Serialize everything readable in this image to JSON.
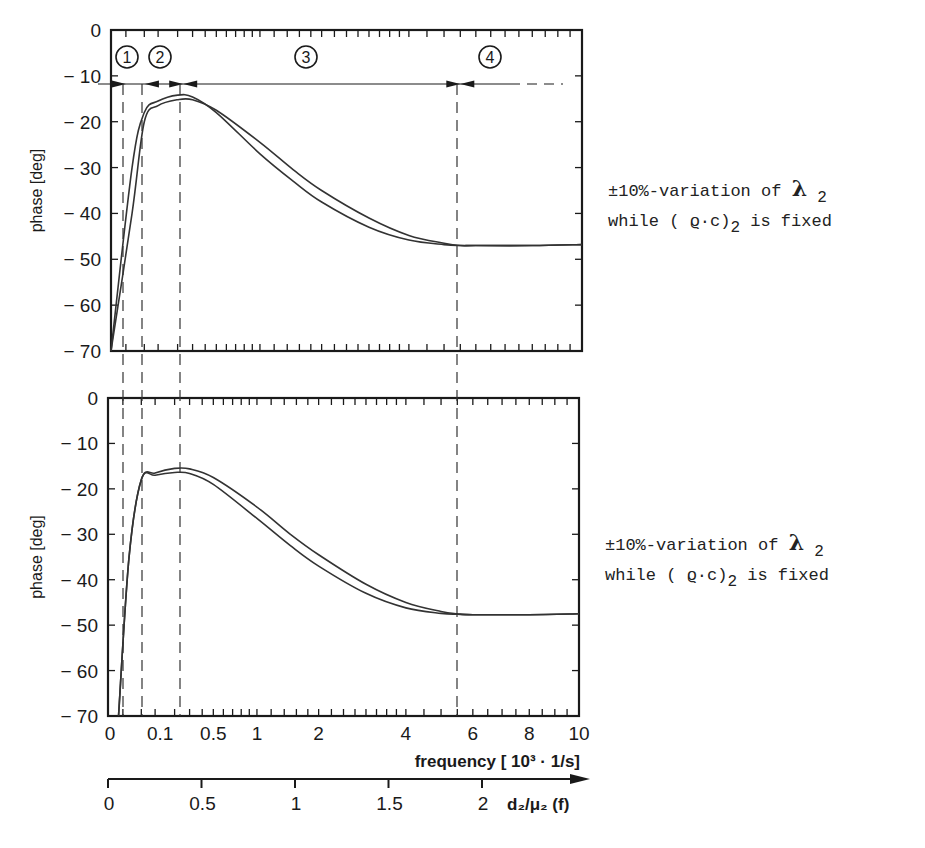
{
  "chart_data": [
    {
      "type": "line",
      "title": "",
      "xlabel": "frequency [ 10^3 · 1/s ]",
      "ylabel": "phase [deg]",
      "xscale": "sqrt",
      "xlim": [
        0,
        10
      ],
      "ylim": [
        -70,
        0
      ],
      "xticks": [
        0,
        0.1,
        0.5,
        1,
        2,
        4,
        6,
        8,
        10
      ],
      "yticks": [
        0,
        -10,
        -20,
        -30,
        -40,
        -50,
        -60,
        -70
      ],
      "region_markers": {
        "labels": [
          "1",
          "2",
          "3",
          "4"
        ],
        "boundaries_freq": [
          0.01,
          0.052,
          0.235,
          5.5
        ]
      },
      "series": [
        {
          "name": "lambda2 +10%",
          "x": [
            0.0,
            0.02,
            0.05,
            0.1,
            0.2,
            0.3,
            0.5,
            1,
            1.5,
            2,
            3,
            4,
            5,
            5.5,
            6,
            8,
            10
          ],
          "values": [
            -70,
            -30,
            -18,
            -15.5,
            -14.2,
            -14.6,
            -18,
            -27,
            -33,
            -37.5,
            -43,
            -45.8,
            -46.8,
            -47,
            -47,
            -47,
            -46.8
          ]
        },
        {
          "name": "lambda2 -10%",
          "x": [
            0.0,
            0.02,
            0.05,
            0.1,
            0.2,
            0.3,
            0.5,
            1,
            1.5,
            2,
            3,
            4,
            5,
            5.5,
            6,
            8,
            10
          ],
          "values": [
            -70,
            -40,
            -20,
            -16.5,
            -15.2,
            -15.2,
            -17.5,
            -24.5,
            -30.5,
            -35,
            -41,
            -44.8,
            -46.5,
            -47,
            -47,
            -47,
            -46.8
          ]
        }
      ],
      "annotation": "±10%-variation of λ2 while (ϱ·c)2 is fixed"
    },
    {
      "type": "line",
      "title": "",
      "xlabel": "frequency [ 10^3 · 1/s ]",
      "ylabel": "phase [deg]",
      "xscale": "sqrt",
      "xlim": [
        0,
        10
      ],
      "ylim": [
        -70,
        0
      ],
      "xticks": [
        0,
        0.1,
        0.5,
        1,
        2,
        4,
        6,
        8,
        10
      ],
      "yticks": [
        0,
        -10,
        -20,
        -30,
        -40,
        -50,
        -60,
        -70
      ],
      "series": [
        {
          "name": "curve A",
          "x": [
            0.005,
            0.02,
            0.05,
            0.1,
            0.2,
            0.3,
            0.5,
            1,
            1.5,
            2,
            3,
            4,
            5,
            5.5,
            6,
            8,
            10
          ],
          "values": [
            -70,
            -35,
            -18,
            -16.5,
            -15.5,
            -15.6,
            -17.5,
            -24,
            -30,
            -34.5,
            -41,
            -45,
            -47,
            -47.5,
            -47.7,
            -47.7,
            -47.5
          ]
        },
        {
          "name": "curve B",
          "x": [
            0.005,
            0.02,
            0.05,
            0.1,
            0.2,
            0.3,
            0.5,
            1,
            1.5,
            2,
            3,
            4,
            5,
            5.5,
            6,
            8,
            10
          ],
          "values": [
            -70,
            -35,
            -18,
            -17,
            -16.4,
            -16.6,
            -19,
            -26.5,
            -32.5,
            -37,
            -43,
            -46.2,
            -47.4,
            -47.6,
            -47.7,
            -47.7,
            -47.5
          ]
        }
      ],
      "annotation": "±10%-variation of λ2 while (ϱ·c)2 is fixed"
    }
  ],
  "upper": {
    "y_axis_label": "phase [deg]",
    "y_tick_labels": [
      "0",
      "− 10",
      "− 20",
      "− 30",
      "− 40",
      "− 50",
      "− 60",
      "− 70"
    ],
    "regions": [
      "1",
      "2",
      "3",
      "4"
    ],
    "note_line1_prefix": "±10%-variation  of ",
    "note_lambda": "λ",
    "note_sub": "2",
    "note_line2_a": "while ( ",
    "note_rho": "ϱ",
    "note_line2_b": "·c)",
    "note_sub2": "2",
    "note_line2_c": " is fixed"
  },
  "lower": {
    "y_axis_label": "phase [deg]",
    "y_tick_labels": [
      "0",
      "− 10",
      "− 20",
      "− 30",
      "− 40",
      "− 50",
      "− 60",
      "− 70"
    ],
    "x_tick_labels": [
      "0",
      "0.1",
      "0.5",
      "1",
      "2",
      "4",
      "6",
      "8",
      "10"
    ],
    "x_axis_label": "frequency [ 10³ · 1/s]",
    "note_line1_prefix": "±10%-variation of ",
    "note_lambda": "λ",
    "note_sub": "2",
    "note_line2_a": "while ( ",
    "note_rho": "ϱ",
    "note_line2_b": "·c)",
    "note_sub2": "2",
    "note_line2_c": " is fixed"
  },
  "secondary_axis": {
    "tick_labels": [
      "0",
      "0.5",
      "1",
      "1.5",
      "2"
    ],
    "label": "d₂/μ₂  (f)"
  }
}
